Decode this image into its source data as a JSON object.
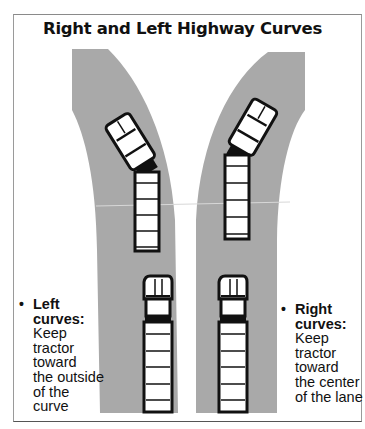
{
  "title": "Right and Left Highway Curves",
  "colors": {
    "road": "#a9a9a9",
    "truck_outline": "#111111",
    "truck_fill": "#ffffff",
    "background": "#ffffff"
  },
  "captions": {
    "left": {
      "bullet": "•",
      "heading_line1": "Left",
      "heading_line2": "curves:",
      "body_lines": [
        "Keep",
        "tractor",
        "toward",
        "the outside",
        "of the",
        "curve"
      ]
    },
    "right": {
      "bullet": "•",
      "heading_line1": "Right",
      "heading_line2": "curves:",
      "body_lines": [
        "Keep",
        "tractor",
        "toward",
        "the center",
        "of the lane"
      ]
    }
  },
  "roads": [
    {
      "name": "left-curve-road",
      "trucks": [
        "turning-truck",
        "straight-truck"
      ]
    },
    {
      "name": "right-curve-road",
      "trucks": [
        "turning-truck",
        "straight-truck"
      ]
    }
  ]
}
